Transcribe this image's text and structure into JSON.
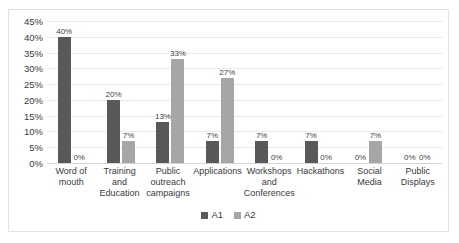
{
  "chart_data": {
    "type": "bar",
    "title": "",
    "subtitle": "",
    "xlabel": "",
    "ylabel": "",
    "ylim": [
      0,
      45
    ],
    "ytick_step": 5,
    "ytick_labels": [
      "45%",
      "40%",
      "35%",
      "30%",
      "25%",
      "20%",
      "15%",
      "10%",
      "5%",
      "0%"
    ],
    "ytick_values": [
      45,
      40,
      35,
      30,
      25,
      20,
      15,
      10,
      5,
      0
    ],
    "grid": true,
    "grid_axis": "y",
    "legend_position": "bottom",
    "categories": [
      "Word of mouth",
      "Training and Education",
      "Public outreach campaigns",
      "Applications",
      "Workshops and Conferences",
      "Hackathons",
      "Social Media",
      "Public Displays"
    ],
    "series": [
      {
        "name": "A1",
        "color": "#595959",
        "values": [
          40,
          20,
          13,
          7,
          7,
          7,
          0,
          0
        ],
        "labels": [
          "40%",
          "20%",
          "13%",
          "7%",
          "7%",
          "7%",
          "0%",
          "0%"
        ]
      },
      {
        "name": "A2",
        "color": "#a6a6a6",
        "values": [
          0,
          7,
          33,
          27,
          0,
          0,
          7,
          0
        ],
        "labels": [
          "0%",
          "7%",
          "33%",
          "27%",
          "0%",
          "0%",
          "7%",
          "0%"
        ]
      }
    ]
  },
  "colors": {
    "series_a1": "#595959",
    "series_a2": "#a6a6a6",
    "gridline": "#e9e9e9",
    "axis": "#d4d4d4",
    "border": "#e2e2e2",
    "text": "#3a3a3a",
    "background": "#ffffff"
  }
}
